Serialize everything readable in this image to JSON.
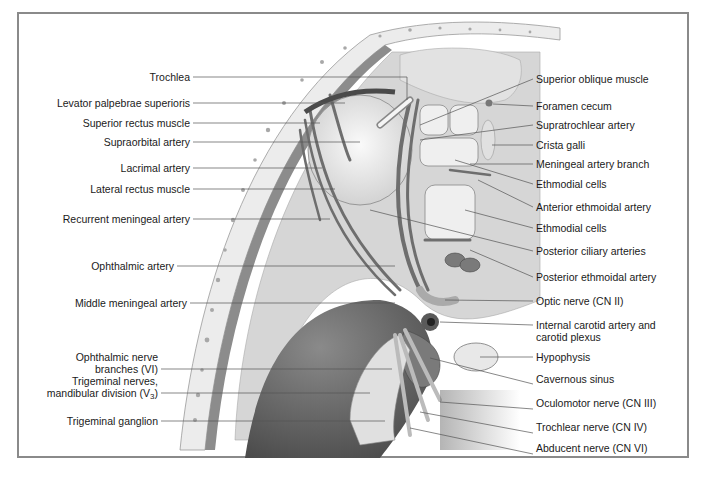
{
  "figure": {
    "colors": {
      "frame_border": "#8a8a8a",
      "bone": "#ececec",
      "bone_dots": "#a8a8a8",
      "dura": "#8c8c8c",
      "tissue": "#d6d6d6",
      "vessels": "#6e6e6e",
      "deep_shadow": "#5a5a5a",
      "leader_line": "#555555"
    }
  },
  "labels_left": [
    {
      "id": "trochlea",
      "text": "Trochlea",
      "y": 77
    },
    {
      "id": "levator",
      "text": "Levator palpebrae superioris",
      "y": 103
    },
    {
      "id": "superior-rectus",
      "text": "Superior rectus muscle",
      "y": 123
    },
    {
      "id": "supraorbital",
      "text": "Supraorbital artery",
      "y": 142
    },
    {
      "id": "lacrimal",
      "text": "Lacrimal artery",
      "y": 168
    },
    {
      "id": "lateral-rectus",
      "text": "Lateral rectus muscle",
      "y": 189
    },
    {
      "id": "recurrent-meningeal",
      "text": "Recurrent meningeal artery",
      "y": 219
    },
    {
      "id": "ophthalmic-artery",
      "text": "Ophthalmic artery",
      "y": 266
    },
    {
      "id": "middle-meningeal",
      "text": "Middle meningeal artery",
      "y": 303
    }
  ],
  "labels_left_multi": [
    {
      "id": "ophthalmic-nerve",
      "line1": "Ophthalmic nerve",
      "line2": "branches (VI)",
      "y": 362
    },
    {
      "id": "trigeminal-mandibular",
      "line1": "Trigeminal nerves,",
      "line2": "mandibular division (V",
      "sub": "3",
      "close": ")",
      "y": 386
    }
  ],
  "labels_left_last": {
    "id": "trigeminal-ganglion",
    "text": "Trigeminal ganglion",
    "y": 415
  },
  "labels_right": [
    {
      "id": "superior-oblique",
      "text": "Superior oblique muscle",
      "y": 73
    },
    {
      "id": "foramen-cecum",
      "text": "Foramen cecum",
      "y": 101
    },
    {
      "id": "supratrochlear",
      "text": "Supratrochlear artery",
      "y": 120
    },
    {
      "id": "crista-galli",
      "text": "Crista galli",
      "y": 140
    },
    {
      "id": "meningeal-branch",
      "text": "Meningeal artery branch",
      "y": 158
    },
    {
      "id": "ethmoidal-cells-1",
      "text": "Ethmodial cells",
      "y": 178
    },
    {
      "id": "anterior-ethmoidal",
      "text": "Anterior ethmoidal artery",
      "y": 201
    },
    {
      "id": "ethmoidal-cells-2",
      "text": "Ethmodial cells",
      "y": 222
    },
    {
      "id": "posterior-ciliary",
      "text": "Posterior ciliary arteries",
      "y": 245
    },
    {
      "id": "posterior-ethmoidal",
      "text": "Posterior ethmoidal artery",
      "y": 271
    },
    {
      "id": "optic-nerve",
      "text": "Optic nerve (CN II)",
      "y": 295
    },
    {
      "id": "internal-carotid",
      "text": "Internal carotid artery and",
      "line2": "carotid plexus",
      "y": 324
    },
    {
      "id": "hypophysis",
      "text": "Hypophysis",
      "y": 356
    },
    {
      "id": "cavernous-sinus",
      "text": "Cavernous sinus",
      "y": 378
    },
    {
      "id": "oculomotor",
      "text": "Oculomotor nerve (CN III)",
      "y": 403
    },
    {
      "id": "trochlear-nerve",
      "text": "Trochlear nerve (CN IV)",
      "y": 427
    },
    {
      "id": "abducent",
      "text": "Abducent nerve (CN VI)",
      "y": 448
    }
  ]
}
